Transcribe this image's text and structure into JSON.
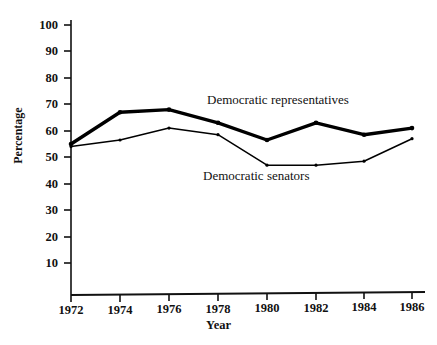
{
  "chart_data": {
    "type": "line",
    "title": "",
    "xlabel": "Year",
    "ylabel": "Percentage",
    "x": [
      1972,
      1974,
      1976,
      1978,
      1980,
      1982,
      1984,
      1986
    ],
    "categories": [
      "1972",
      "1974",
      "1976",
      "1978",
      "1980",
      "1982",
      "1984",
      "1986"
    ],
    "xlim": [
      1972,
      1986
    ],
    "ylim": [
      0,
      100
    ],
    "yticks": [
      10,
      20,
      30,
      40,
      50,
      60,
      70,
      80,
      90,
      100
    ],
    "ytick_labels": [
      "10",
      "20",
      "30",
      "40",
      "50",
      "60",
      "70",
      "80",
      "90",
      "100"
    ],
    "grid": false,
    "legend_position": "inline-annotations",
    "series": [
      {
        "name": "Democratic representatives",
        "values": [
          55,
          67,
          68,
          63,
          56.5,
          63,
          58.5,
          61
        ],
        "line_width": "thick",
        "color": "#000000",
        "annotation": "Democratic representatives"
      },
      {
        "name": "Democratic senators",
        "values": [
          54,
          56.5,
          61,
          58.5,
          47,
          47,
          48.5,
          57
        ],
        "line_width": "thin",
        "color": "#000000",
        "annotation": "Democratic senators"
      }
    ]
  },
  "axes": {
    "y_title": "Percentage",
    "x_title": "Year"
  }
}
